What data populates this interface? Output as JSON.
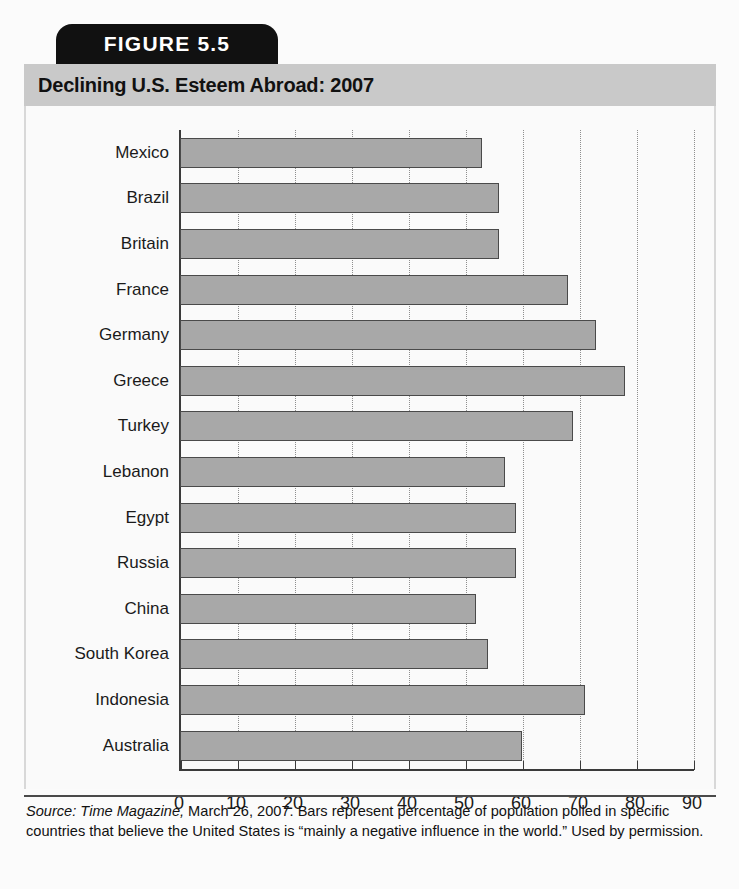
{
  "figure": {
    "tab_label": "FIGURE 5.5",
    "title": "Declining U.S. Esteem Abroad: 2007"
  },
  "caption": {
    "source_word": "Source:",
    "publication": "Time Magazine,",
    "rest": " March 26, 2007. Bars represent percentage of population polled in specific countries that believe the United States is “mainly a negative influence in the world.” Used by permission."
  },
  "colors": {
    "bar_fill": "#a8a8a8",
    "bar_stroke": "#4a4a4a",
    "title_band": "#c9c9c9",
    "tab_bg": "#111111",
    "axis": "#3a3a3a",
    "grid": "#8e8e8e"
  },
  "chart_data": {
    "type": "bar",
    "orientation": "horizontal",
    "title": "Declining U.S. Esteem Abroad: 2007",
    "xlabel": "",
    "ylabel": "",
    "xlim": [
      0,
      90
    ],
    "xticks": [
      0,
      10,
      20,
      30,
      40,
      50,
      60,
      70,
      80,
      90
    ],
    "grid": true,
    "legend": false,
    "categories": [
      "Mexico",
      "Brazil",
      "Britain",
      "France",
      "Germany",
      "Greece",
      "Turkey",
      "Lebanon",
      "Egypt",
      "Russia",
      "China",
      "South Korea",
      "Indonesia",
      "Australia"
    ],
    "values": [
      53,
      56,
      56,
      68,
      73,
      78,
      69,
      57,
      59,
      59,
      52,
      54,
      71,
      60
    ]
  }
}
